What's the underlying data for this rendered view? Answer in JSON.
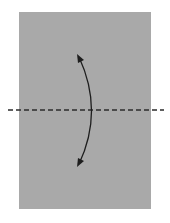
{
  "diagram": {
    "type": "origami-fold-step",
    "paper": {
      "color": "#a9a9a9",
      "x": 19,
      "y": 12,
      "width": 132,
      "height": 197
    },
    "fold_line": {
      "style": "valley-dashed",
      "y": 110,
      "x1": 8,
      "x2": 164,
      "color": "#2b2b2b"
    },
    "arrow": {
      "type": "double-curved",
      "from": [
        78,
        56
      ],
      "to": [
        78,
        166
      ],
      "color": "#1e1e1e"
    },
    "background": "#ffffff"
  }
}
